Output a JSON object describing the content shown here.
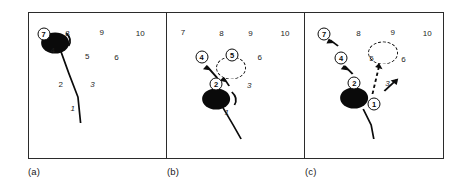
{
  "figure": {
    "caption_labels": [
      "(a)",
      "(b)",
      "(c)"
    ],
    "panel_count": 3
  },
  "panels": [
    {
      "id": "panel-a",
      "label": "(a)",
      "plain_numbers": [
        {
          "text": "8",
          "x": 29,
          "y": 21,
          "italic": false
        },
        {
          "text": "9",
          "x": 55,
          "y": 20,
          "italic": false
        },
        {
          "text": "10",
          "x": 84,
          "y": 21,
          "italic": false
        },
        {
          "text": "5",
          "x": 44,
          "y": 44,
          "italic": false
        },
        {
          "text": "6",
          "x": 66,
          "y": 45,
          "italic": false
        },
        {
          "text": "4",
          "x": 18,
          "y": 38,
          "italic": false
        },
        {
          "text": "2",
          "x": 24,
          "y": 72,
          "italic": false
        },
        {
          "text": "3",
          "x": 48,
          "y": 72,
          "italic": true
        },
        {
          "text": "1",
          "x": 33,
          "y": 96,
          "italic": true
        }
      ],
      "circled_numbers": [
        {
          "text": "7",
          "x": 11,
          "y": 21
        }
      ],
      "balls": [
        {
          "x": 20,
          "y": 30,
          "d": 21
        }
      ],
      "ghost_circles": [],
      "trajectories": [
        {
          "kind": "cue-stick-line",
          "points": "24,38 30,60 37,84 39,110"
        },
        {
          "kind": "spin-arc",
          "path": "M 28,21 q 4,5 2,12"
        }
      ],
      "arrows": []
    },
    {
      "id": "panel-b",
      "label": "(b)",
      "plain_numbers": [
        {
          "text": "7",
          "x": 12,
          "y": 20,
          "italic": false
        },
        {
          "text": "8",
          "x": 41,
          "y": 21,
          "italic": false
        },
        {
          "text": "9",
          "x": 63,
          "y": 21,
          "italic": false
        },
        {
          "text": "10",
          "x": 89,
          "y": 21,
          "italic": false
        },
        {
          "text": "6",
          "x": 70,
          "y": 45,
          "italic": false
        },
        {
          "text": "3",
          "x": 62,
          "y": 73,
          "italic": true
        },
        {
          "text": "1",
          "x": 45,
          "y": 100,
          "italic": true
        }
      ],
      "circled_numbers": [
        {
          "text": "4",
          "x": 26,
          "y": 44
        },
        {
          "text": "5",
          "x": 49,
          "y": 42
        },
        {
          "text": "2",
          "x": 37,
          "y": 71
        }
      ],
      "balls": [
        {
          "x": 37,
          "y": 86,
          "d": 21
        }
      ],
      "ghost_circles": [
        {
          "x": 48,
          "y": 55,
          "d": 21
        }
      ],
      "trajectories": [
        {
          "kind": "cue-stick-line",
          "points": "42,94 50,112 56,124"
        },
        {
          "kind": "spin-arc",
          "path": "M 48,80 q 5,5 3,12"
        }
      ],
      "arrows": [
        {
          "from_x": 38,
          "from_y": 64,
          "to_x": 29,
          "to_y": 51
        },
        {
          "from_x": 45,
          "from_y": 72,
          "to_x": 42,
          "to_y": 64
        }
      ]
    },
    {
      "id": "panel-c",
      "label": "(c)",
      "plain_numbers": [
        {
          "text": "8",
          "x": 40,
          "y": 21,
          "italic": false
        },
        {
          "text": "9",
          "x": 66,
          "y": 20,
          "italic": false
        },
        {
          "text": "10",
          "x": 92,
          "y": 21,
          "italic": false
        },
        {
          "text": "5",
          "x": 50,
          "y": 46,
          "italic": false
        },
        {
          "text": "6",
          "x": 74,
          "y": 47,
          "italic": false
        },
        {
          "text": "3",
          "x": 62,
          "y": 71,
          "italic": true
        }
      ],
      "circled_numbers": [
        {
          "text": "7",
          "x": 14,
          "y": 21
        },
        {
          "text": "4",
          "x": 27,
          "y": 45
        },
        {
          "text": "2",
          "x": 37,
          "y": 70
        },
        {
          "text": "1",
          "x": 52,
          "y": 91
        }
      ],
      "balls": [
        {
          "x": 37,
          "y": 85,
          "d": 21
        }
      ],
      "ghost_circles": [
        {
          "x": 59,
          "y": 40,
          "d": 21
        }
      ],
      "trajectories": [
        {
          "kind": "cue-stick-line",
          "points": "44,96 50,112 52,124"
        },
        {
          "kind": "dashed-path",
          "path": "M 51,82 L 56,52"
        }
      ],
      "arrows": [
        {
          "from_x": 25,
          "from_y": 32,
          "to_x": 18,
          "to_y": 26
        },
        {
          "from_x": 36,
          "from_y": 60,
          "to_x": 30,
          "to_y": 52
        },
        {
          "from_x": 60,
          "from_y": 77,
          "to_x": 69,
          "to_y": 66
        }
      ]
    }
  ]
}
